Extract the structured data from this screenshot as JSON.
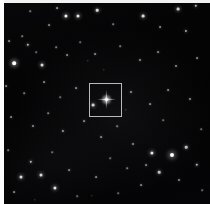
{
  "view": {
    "title": "Star field image with target marker",
    "width": 210,
    "height": 204,
    "background_color": "#040404",
    "page_margin_color": "#fdfdfd"
  },
  "target_box": {
    "label": "target-reticle",
    "x": 89,
    "y": 83,
    "width": 33,
    "height": 34,
    "stroke_color": "#b9b9b9",
    "stroke_width": 1
  },
  "primary_star": {
    "label": "central-target-star",
    "x": 106,
    "y": 99,
    "core_size": 3,
    "spike_length": 19,
    "glow_size": 11,
    "color": "#ffffff"
  },
  "stars": [
    {
      "x": 66,
      "y": 16,
      "r": 1.6,
      "b": 0.95
    },
    {
      "x": 78,
      "y": 16,
      "r": 1.5,
      "b": 0.9
    },
    {
      "x": 97,
      "y": 10,
      "r": 1.3,
      "b": 0.85
    },
    {
      "x": 143,
      "y": 16,
      "r": 1.4,
      "b": 0.85
    },
    {
      "x": 178,
      "y": 9,
      "r": 1.4,
      "b": 0.8
    },
    {
      "x": 196,
      "y": 6,
      "r": 1.2,
      "b": 0.7
    },
    {
      "x": 57,
      "y": 8,
      "r": 0.9,
      "b": 0.55
    },
    {
      "x": 30,
      "y": 11,
      "r": 0.8,
      "b": 0.45
    },
    {
      "x": 49,
      "y": 25,
      "r": 0.9,
      "b": 0.5
    },
    {
      "x": 113,
      "y": 24,
      "r": 0.8,
      "b": 0.45
    },
    {
      "x": 160,
      "y": 27,
      "r": 0.9,
      "b": 0.5
    },
    {
      "x": 186,
      "y": 31,
      "r": 1.1,
      "b": 0.65
    },
    {
      "x": 14,
      "y": 63,
      "r": 1.8,
      "b": 1.0
    },
    {
      "x": 28,
      "y": 45,
      "r": 1.2,
      "b": 0.7
    },
    {
      "x": 42,
      "y": 65,
      "r": 1.5,
      "b": 0.85
    },
    {
      "x": 9,
      "y": 41,
      "r": 0.9,
      "b": 0.5
    },
    {
      "x": 22,
      "y": 36,
      "r": 0.8,
      "b": 0.45
    },
    {
      "x": 36,
      "y": 52,
      "r": 0.8,
      "b": 0.4
    },
    {
      "x": 56,
      "y": 47,
      "r": 0.8,
      "b": 0.45
    },
    {
      "x": 67,
      "y": 55,
      "r": 0.9,
      "b": 0.5
    },
    {
      "x": 80,
      "y": 42,
      "r": 0.8,
      "b": 0.4
    },
    {
      "x": 95,
      "y": 54,
      "r": 0.9,
      "b": 0.5
    },
    {
      "x": 120,
      "y": 46,
      "r": 0.8,
      "b": 0.45
    },
    {
      "x": 140,
      "y": 60,
      "r": 1.0,
      "b": 0.55
    },
    {
      "x": 158,
      "y": 52,
      "r": 0.9,
      "b": 0.5
    },
    {
      "x": 176,
      "y": 66,
      "r": 1.0,
      "b": 0.55
    },
    {
      "x": 197,
      "y": 58,
      "r": 0.9,
      "b": 0.5
    },
    {
      "x": 6,
      "y": 86,
      "r": 0.9,
      "b": 0.5
    },
    {
      "x": 24,
      "y": 93,
      "r": 0.8,
      "b": 0.45
    },
    {
      "x": 44,
      "y": 82,
      "r": 0.9,
      "b": 0.5
    },
    {
      "x": 60,
      "y": 97,
      "r": 0.8,
      "b": 0.4
    },
    {
      "x": 76,
      "y": 88,
      "r": 0.9,
      "b": 0.5
    },
    {
      "x": 93,
      "y": 105,
      "r": 1.4,
      "b": 0.8
    },
    {
      "x": 131,
      "y": 92,
      "r": 1.0,
      "b": 0.55
    },
    {
      "x": 150,
      "y": 104,
      "r": 0.9,
      "b": 0.5
    },
    {
      "x": 168,
      "y": 90,
      "r": 0.9,
      "b": 0.5
    },
    {
      "x": 190,
      "y": 99,
      "r": 1.0,
      "b": 0.55
    },
    {
      "x": 11,
      "y": 117,
      "r": 0.9,
      "b": 0.5
    },
    {
      "x": 33,
      "y": 126,
      "r": 1.0,
      "b": 0.55
    },
    {
      "x": 48,
      "y": 113,
      "r": 0.8,
      "b": 0.45
    },
    {
      "x": 63,
      "y": 131,
      "r": 1.1,
      "b": 0.6
    },
    {
      "x": 84,
      "y": 121,
      "r": 0.9,
      "b": 0.5
    },
    {
      "x": 101,
      "y": 137,
      "r": 0.9,
      "b": 0.5
    },
    {
      "x": 117,
      "y": 126,
      "r": 0.8,
      "b": 0.45
    },
    {
      "x": 133,
      "y": 144,
      "r": 1.0,
      "b": 0.55
    },
    {
      "x": 152,
      "y": 153,
      "r": 1.6,
      "b": 0.9
    },
    {
      "x": 172,
      "y": 155,
      "r": 2.0,
      "b": 1.0
    },
    {
      "x": 186,
      "y": 147,
      "r": 1.3,
      "b": 0.75
    },
    {
      "x": 197,
      "y": 165,
      "r": 1.2,
      "b": 0.7
    },
    {
      "x": 159,
      "y": 172,
      "r": 1.3,
      "b": 0.75
    },
    {
      "x": 179,
      "y": 180,
      "r": 1.0,
      "b": 0.55
    },
    {
      "x": 141,
      "y": 185,
      "r": 0.9,
      "b": 0.5
    },
    {
      "x": 146,
      "y": 165,
      "r": 0.9,
      "b": 0.5
    },
    {
      "x": 127,
      "y": 168,
      "r": 0.8,
      "b": 0.45
    },
    {
      "x": 110,
      "y": 158,
      "r": 0.8,
      "b": 0.4
    },
    {
      "x": 118,
      "y": 193,
      "r": 0.8,
      "b": 0.4
    },
    {
      "x": 96,
      "y": 177,
      "r": 0.9,
      "b": 0.5
    },
    {
      "x": 21,
      "y": 177,
      "r": 1.5,
      "b": 0.85
    },
    {
      "x": 41,
      "y": 175,
      "r": 1.5,
      "b": 0.85
    },
    {
      "x": 55,
      "y": 188,
      "r": 1.6,
      "b": 0.9
    },
    {
      "x": 31,
      "y": 162,
      "r": 1.2,
      "b": 0.7
    },
    {
      "x": 14,
      "y": 192,
      "r": 0.9,
      "b": 0.5
    },
    {
      "x": 69,
      "y": 170,
      "r": 0.9,
      "b": 0.5
    },
    {
      "x": 77,
      "y": 196,
      "r": 0.8,
      "b": 0.4
    },
    {
      "x": 8,
      "y": 150,
      "r": 0.8,
      "b": 0.45
    },
    {
      "x": 52,
      "y": 152,
      "r": 0.8,
      "b": 0.4
    },
    {
      "x": 88,
      "y": 61,
      "r": 0.7,
      "b": 0.35
    },
    {
      "x": 104,
      "y": 70,
      "r": 0.7,
      "b": 0.35
    },
    {
      "x": 126,
      "y": 110,
      "r": 0.7,
      "b": 0.35
    },
    {
      "x": 163,
      "y": 120,
      "r": 0.8,
      "b": 0.4
    },
    {
      "x": 201,
      "y": 129,
      "r": 0.8,
      "b": 0.4
    },
    {
      "x": 202,
      "y": 190,
      "r": 0.8,
      "b": 0.4
    },
    {
      "x": 92,
      "y": 196,
      "r": 0.7,
      "b": 0.35
    },
    {
      "x": 35,
      "y": 200,
      "r": 0.7,
      "b": 0.35
    }
  ]
}
